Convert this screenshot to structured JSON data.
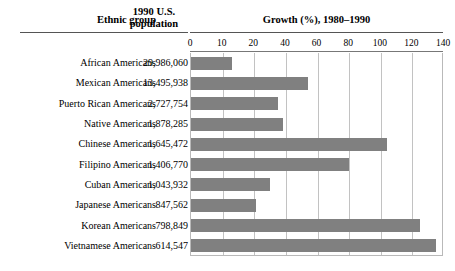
{
  "header": {
    "col_ethnic": "Ethnic group",
    "col_population_line1": "1990 U.S.",
    "col_population_line2": "population",
    "col_growth": "Growth (%), 1980–1990"
  },
  "chart_data": {
    "type": "bar",
    "orientation": "horizontal",
    "title": "Growth (%), 1980–1990",
    "xlabel": "Growth (%), 1980–1990",
    "ylabel": "Ethnic group",
    "grid": true,
    "legend": false,
    "xlim": [
      0,
      140
    ],
    "tick_labels": [
      "0",
      "10",
      "20",
      "40",
      "60",
      "80",
      "100",
      "120",
      "140"
    ],
    "bar_color": "#808080",
    "categories": [
      "African Americans",
      "Mexican Americans",
      "Puerto Rican Americans",
      "Native Americans",
      "Chinese Americans",
      "Filipino Americans",
      "Cuban Americans",
      "Japanese Americans",
      "Korean Americans",
      "Vietnamese Americans"
    ],
    "values": [
      13,
      54,
      35,
      38,
      104,
      80,
      30,
      21,
      125,
      135
    ],
    "populations": [
      "29,986,060",
      "13,495,938",
      "2,727,754",
      "1,878,285",
      "1,645,472",
      "1,406,770",
      "1,043,932",
      "847,562",
      "798,849",
      "614,547"
    ]
  }
}
